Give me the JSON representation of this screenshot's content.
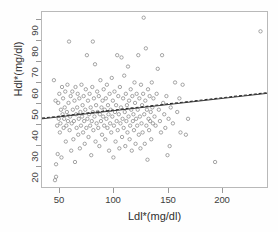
{
  "chart_data": {
    "type": "scatter",
    "title": "",
    "xlabel": "Ldl*(mg/dl)",
    "ylabel": "Hdl*(mg/dl)",
    "xlim": [
      35,
      243
    ],
    "ylim": [
      17,
      94
    ],
    "xticks": [
      50,
      100,
      150,
      200
    ],
    "yticks": [
      20,
      30,
      40,
      50,
      60,
      70,
      80,
      90
    ],
    "xtick_labels": [
      "50",
      "100",
      "150",
      "200"
    ],
    "ytick_labels": [
      "20",
      "30",
      "40",
      "50",
      "60",
      "70",
      "80",
      "90"
    ],
    "grid": false,
    "legend": false,
    "marker": {
      "style": "open-circle",
      "size_px": 3.4,
      "color": "#8d8d8d",
      "fill": "none"
    },
    "frame_color": "#b9b9b9",
    "background": "#ffffff",
    "series": [
      {
        "name": "observations",
        "marker": "open-circle",
        "points": [
          [
            46,
            64
          ],
          [
            47,
            20
          ],
          [
            48,
            21.5
          ],
          [
            47.5,
            55
          ],
          [
            48,
            27
          ],
          [
            49,
            44
          ],
          [
            49.5,
            31.5
          ],
          [
            50,
            54
          ],
          [
            50.5,
            47
          ],
          [
            51,
            58
          ],
          [
            51.5,
            41
          ],
          [
            52,
            45
          ],
          [
            52.5,
            51
          ],
          [
            53,
            30
          ],
          [
            53.5,
            61
          ],
          [
            54,
            49
          ],
          [
            54.5,
            56
          ],
          [
            55,
            43
          ],
          [
            55.5,
            47
          ],
          [
            56,
            52
          ],
          [
            56.5,
            59
          ],
          [
            57,
            37
          ],
          [
            57.5,
            44
          ],
          [
            58,
            50
          ],
          [
            58.5,
            62
          ],
          [
            59,
            46
          ],
          [
            59.5,
            54
          ],
          [
            60,
            81
          ],
          [
            60.5,
            42
          ],
          [
            61,
            48
          ],
          [
            61.5,
            57
          ],
          [
            62,
            33
          ],
          [
            62.5,
            45
          ],
          [
            63,
            59
          ],
          [
            63.5,
            51
          ],
          [
            64,
            38
          ],
          [
            64.5,
            46
          ],
          [
            65,
            55
          ],
          [
            65.5,
            28
          ],
          [
            66,
            61
          ],
          [
            66.5,
            49
          ],
          [
            67,
            43
          ],
          [
            67.5,
            52
          ],
          [
            68,
            58
          ],
          [
            68.5,
            40
          ],
          [
            69,
            47
          ],
          [
            69.5,
            56
          ],
          [
            70,
            34
          ],
          [
            70.5,
            50
          ],
          [
            71,
            44
          ],
          [
            71.5,
            62
          ],
          [
            72,
            48
          ],
          [
            72.5,
            53
          ],
          [
            73,
            41
          ],
          [
            73.5,
            57
          ],
          [
            74,
            46
          ],
          [
            74.5,
            36
          ],
          [
            75,
            51
          ],
          [
            75.5,
            60
          ],
          [
            76,
            43
          ],
          [
            76.5,
            75
          ],
          [
            77,
            47
          ],
          [
            77.5,
            55
          ],
          [
            78,
            39
          ],
          [
            78.5,
            49
          ],
          [
            79,
            58
          ],
          [
            79.5,
            44
          ],
          [
            80,
            52
          ],
          [
            80.5,
            31
          ],
          [
            81,
            46
          ],
          [
            81.5,
            61
          ],
          [
            82,
            81
          ],
          [
            82,
            50
          ],
          [
            82.5,
            42
          ],
          [
            83,
            56
          ],
          [
            83.5,
            48
          ],
          [
            84,
            71
          ],
          [
            84.5,
            37
          ],
          [
            85,
            53
          ],
          [
            85.5,
            45
          ],
          [
            86,
            59
          ],
          [
            86.5,
            50
          ],
          [
            87,
            43
          ],
          [
            87.5,
            57
          ],
          [
            88,
            35
          ],
          [
            88.5,
            49
          ],
          [
            89,
            64
          ],
          [
            89.5,
            46
          ],
          [
            90,
            52
          ],
          [
            90.5,
            40
          ],
          [
            91,
            55
          ],
          [
            91.5,
            48
          ],
          [
            92,
            60
          ],
          [
            92.5,
            44
          ],
          [
            93,
            51
          ],
          [
            93.5,
            38
          ],
          [
            94,
            56
          ],
          [
            94.5,
            47
          ],
          [
            95,
            62
          ],
          [
            95.5,
            43
          ],
          [
            96,
            53
          ],
          [
            96.5,
            49
          ],
          [
            97,
            33
          ],
          [
            97.5,
            58
          ],
          [
            98,
            45
          ],
          [
            98.5,
            51
          ],
          [
            99,
            41
          ],
          [
            99.5,
            65
          ],
          [
            100,
            48
          ],
          [
            100.5,
            55
          ],
          [
            101,
            30
          ],
          [
            101.5,
            44
          ],
          [
            102,
            59
          ],
          [
            102.5,
            50
          ],
          [
            103,
            37
          ],
          [
            103.5,
            53
          ],
          [
            104,
            46
          ],
          [
            104.5,
            75
          ],
          [
            105,
            42
          ],
          [
            105.5,
            57
          ],
          [
            106,
            49
          ],
          [
            106.5,
            34
          ],
          [
            107,
            61
          ],
          [
            107.5,
            45
          ],
          [
            108,
            52
          ],
          [
            108.5,
            74
          ],
          [
            109,
            39
          ],
          [
            109.5,
            47
          ],
          [
            110,
            56
          ],
          [
            110.5,
            43
          ],
          [
            111,
            66
          ],
          [
            111.5,
            50
          ],
          [
            112,
            35
          ],
          [
            112.5,
            58
          ],
          [
            113,
            46
          ],
          [
            113.5,
            53
          ],
          [
            114,
            41
          ],
          [
            114.5,
            70
          ],
          [
            115,
            48
          ],
          [
            115.5,
            55
          ],
          [
            116,
            38
          ],
          [
            116.5,
            44
          ],
          [
            117,
            60
          ],
          [
            117.5,
            51
          ],
          [
            118,
            33
          ],
          [
            118.5,
            57
          ],
          [
            119,
            46
          ],
          [
            119.5,
            49
          ],
          [
            120,
            42
          ],
          [
            120.5,
            63
          ],
          [
            121,
            54
          ],
          [
            121.5,
            36
          ],
          [
            122,
            47
          ],
          [
            122.5,
            58
          ],
          [
            123,
            44
          ],
          [
            123.5,
            51
          ],
          [
            124,
            75
          ],
          [
            124.5,
            40
          ],
          [
            125,
            56
          ],
          [
            125.5,
            48
          ],
          [
            126,
            34
          ],
          [
            126.5,
            62
          ],
          [
            127,
            45
          ],
          [
            127.5,
            53
          ],
          [
            128,
            41
          ],
          [
            128.5,
            58
          ],
          [
            129,
            91.5
          ],
          [
            129.5,
            49
          ],
          [
            130,
            36
          ],
          [
            130.5,
            55
          ],
          [
            131,
            78
          ],
          [
            131.5,
            44
          ],
          [
            132,
            51
          ],
          [
            132.5,
            29
          ],
          [
            133,
            60
          ],
          [
            133.5,
            47
          ],
          [
            134,
            42
          ],
          [
            134.5,
            57
          ],
          [
            135,
            46
          ],
          [
            135.5,
            50
          ],
          [
            136,
            38
          ],
          [
            136.5,
            63
          ],
          [
            137,
            52
          ],
          [
            137.5,
            45
          ],
          [
            138,
            56
          ],
          [
            139,
            48
          ],
          [
            140,
            44
          ],
          [
            141,
            58
          ],
          [
            142,
            69
          ],
          [
            143,
            51
          ],
          [
            144,
            46
          ],
          [
            145,
            41
          ],
          [
            146,
            75
          ],
          [
            147,
            54
          ],
          [
            148,
            49
          ],
          [
            149,
            43
          ],
          [
            150,
            57
          ],
          [
            151,
            31
          ],
          [
            152,
            47
          ],
          [
            153,
            35
          ],
          [
            154,
            52
          ],
          [
            156,
            45
          ],
          [
            158,
            63
          ],
          [
            160,
            50
          ],
          [
            162,
            56
          ],
          [
            163,
            41
          ],
          [
            165,
            62
          ],
          [
            168,
            40
          ],
          [
            170,
            47
          ],
          [
            195,
            28
          ],
          [
            237,
            85.5
          ]
        ]
      }
    ],
    "fit_lines": [
      {
        "name": "regression-line-solid",
        "style": "solid",
        "color": "#3a3a3a",
        "x0": 35,
        "y0": 47.0,
        "x1": 243,
        "y1": 58.2
      },
      {
        "name": "regression-line-dashed",
        "style": "dashed",
        "color": "#2b2b2b",
        "x0": 35,
        "y0": 47.3,
        "x1": 243,
        "y1": 58.5
      }
    ]
  }
}
